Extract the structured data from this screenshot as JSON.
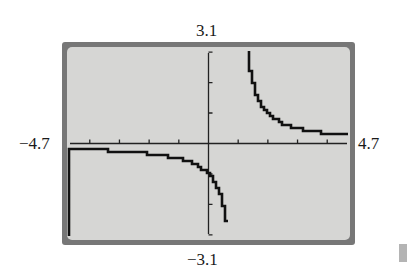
{
  "window": {
    "xmin_label": "−4.7",
    "xmax_label": "4.7",
    "ymax_label": "3.1",
    "ymin_label": "−3.1"
  },
  "colors": {
    "frame": "#777777",
    "screen": "#d6d6d4",
    "plot": "#111111",
    "axes": "#222222"
  },
  "chart_data": {
    "type": "line",
    "title": "",
    "function": "y = 1/(x - 1)",
    "xlabel": "",
    "ylabel": "",
    "xlim": [
      -4.7,
      4.7
    ],
    "ylim": [
      -3.1,
      3.1
    ],
    "xscl": 1,
    "yscl": 1,
    "grid": false,
    "legend": null,
    "tick_labels": {
      "xmin": "-4.7",
      "xmax": "4.7",
      "ymin": "-3.1",
      "ymax": "3.1"
    },
    "vertical_asymptote_x": 1,
    "horizontal_asymptote_y": 0,
    "series": [
      {
        "name": "left branch",
        "x": [
          -4.7,
          -4.0,
          -3.0,
          -2.0,
          -1.0,
          -0.5,
          0.0,
          0.25,
          0.5,
          0.68
        ],
        "y": [
          -0.18,
          -0.2,
          -0.25,
          -0.33,
          -0.5,
          -0.67,
          -1.0,
          -1.33,
          -2.0,
          -3.1
        ]
      },
      {
        "name": "right branch",
        "x": [
          1.32,
          1.5,
          2.0,
          2.5,
          3.0,
          3.5,
          4.0,
          4.6
        ],
        "y": [
          3.1,
          2.0,
          1.0,
          0.67,
          0.5,
          0.4,
          0.33,
          0.28
        ]
      }
    ]
  }
}
